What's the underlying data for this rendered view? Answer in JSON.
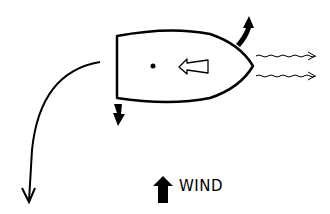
{
  "diagram": {
    "type": "sailing-boat-drift-diagram",
    "labels": {
      "wind": "WIND"
    },
    "elements": {
      "boat": {
        "shape": "hull-top-view",
        "bow_direction": "right"
      },
      "pivot_point": {
        "shape": "dot"
      },
      "heading_arrow": {
        "style": "hollow",
        "direction": "left"
      },
      "bow_force_arrow": {
        "style": "filled-curved",
        "direction": "up"
      },
      "stern_force_arrow": {
        "style": "filled",
        "direction": "down"
      },
      "wake_lines": {
        "count": 2,
        "style": "wavy-arrow",
        "direction": "right"
      },
      "path_arrow": {
        "style": "curved-line",
        "direction": "down-left"
      },
      "wind_arrow": {
        "style": "filled",
        "direction": "up"
      }
    },
    "colors": {
      "stroke": "#000000",
      "background": "#ffffff"
    }
  }
}
